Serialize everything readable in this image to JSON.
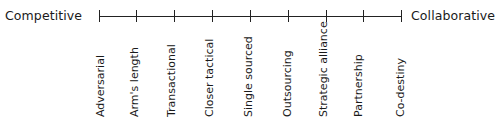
{
  "diagram": {
    "type": "spectrum",
    "left_end": "Competitive",
    "right_end": "Collaborative",
    "stages": [
      "Adversarial",
      "Arm's length",
      "Transactional",
      "Closer tactical",
      "Single sourced",
      "Outsourcing",
      "Strategic alliance",
      "Partnership",
      "Co-destiny"
    ],
    "colors": {
      "line": "#222222",
      "text": "#1a1a1a",
      "background": "#ffffff"
    }
  }
}
